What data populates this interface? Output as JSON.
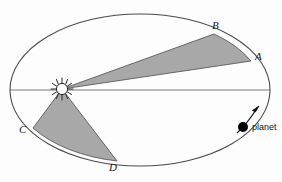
{
  "figure": {
    "background_color": "#fdfdfd",
    "stroke_color": "#4a4a4a",
    "sector_fill": "#a8a8a8",
    "sector_stroke": "#5a5a5a",
    "sun_color": "#ffffff",
    "planet_color": "#000000"
  },
  "orbit": {
    "name": "elliptical-orbit",
    "center_x": 140,
    "center_y": 90,
    "radius_x": 130,
    "radius_y": 76
  },
  "sun": {
    "label": "sun",
    "x": 62,
    "y": 89,
    "radius": 6,
    "ray_count": 12
  },
  "major_axis": {
    "name": "major-axis-line",
    "x1": 10,
    "y1": 90,
    "x2": 270,
    "y2": 90
  },
  "points": [
    {
      "id": "A",
      "label": "A",
      "x": 251,
      "y": 61
    },
    {
      "id": "B",
      "label": "B",
      "x": 214,
      "y": 34
    },
    {
      "id": "C",
      "label": "C",
      "x": 33,
      "y": 128
    },
    {
      "id": "D",
      "label": "D",
      "x": 117,
      "y": 161
    }
  ],
  "sectors": [
    {
      "id": "sector-SAB",
      "name": "upper-shaded-sector",
      "from": "A",
      "to": "B",
      "path": "M 62 89 L 251 61 A 130 76 0 0 0 214 34 Z"
    },
    {
      "id": "sector-SCD",
      "name": "lower-shaded-sector",
      "from": "C",
      "to": "D",
      "path": "M 62 89 L 33 128 A 130 76 0 0 0 117 161 Z"
    }
  ],
  "planet": {
    "label": "planet",
    "x": 243,
    "y": 127,
    "radius": 5
  },
  "direction_arrow": {
    "name": "orbit-direction-arrow",
    "tail_x": 238,
    "tail_y": 132,
    "tip_x": 259,
    "tip_y": 106
  }
}
